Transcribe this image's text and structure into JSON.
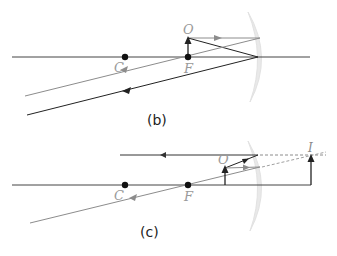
{
  "colors": {
    "axis": "#333333",
    "dark_ray": "#222222",
    "light_ray": "#8c8c8c",
    "mirror": "#e6e6e6",
    "label": "#9a9a9a",
    "caption": "#222222"
  },
  "diagrams": [
    {
      "id": "b",
      "caption": "(b)",
      "labels": {
        "center": "C",
        "focus": "F",
        "object": "O"
      },
      "description": "Object placed at focal point F of a concave mirror; reflected rays are parallel"
    },
    {
      "id": "c",
      "caption": "(c)",
      "labels": {
        "center": "C",
        "focus": "F",
        "object": "O",
        "image": "I"
      },
      "description": "Object between F and the concave mirror; virtual upright enlarged image I behind the mirror"
    }
  ]
}
